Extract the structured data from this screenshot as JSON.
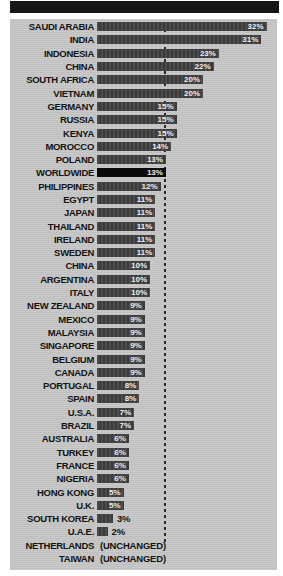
{
  "header": {
    "banner_text": ""
  },
  "chart_data": {
    "type": "bar",
    "orientation": "horizontal",
    "title": "",
    "unit": "%",
    "reference_label": "WORLDWIDE",
    "reference_value": 13,
    "grid": "off",
    "legend": "none",
    "xlim": [
      0,
      34
    ],
    "rows": [
      {
        "label": "SAUDI ARABIA",
        "value": 32,
        "display": "32%"
      },
      {
        "label": "INDIA",
        "value": 31,
        "display": "31%"
      },
      {
        "label": "INDONESIA",
        "value": 23,
        "display": "23%"
      },
      {
        "label": "CHINA",
        "value": 22,
        "display": "22%"
      },
      {
        "label": "SOUTH AFRICA",
        "value": 20,
        "display": "20%"
      },
      {
        "label": "VIETNAM",
        "value": 20,
        "display": "20%"
      },
      {
        "label": "GERMANY",
        "value": 15,
        "display": "15%"
      },
      {
        "label": "RUSSIA",
        "value": 15,
        "display": "15%"
      },
      {
        "label": "KENYA",
        "value": 15,
        "display": "15%"
      },
      {
        "label": "MOROCCO",
        "value": 14,
        "display": "14%"
      },
      {
        "label": "POLAND",
        "value": 13,
        "display": "13%"
      },
      {
        "label": "WORLDWIDE",
        "value": 13,
        "display": "13%",
        "emphasis": true
      },
      {
        "label": "PHILIPPINES",
        "value": 12,
        "display": "12%"
      },
      {
        "label": "EGYPT",
        "value": 11,
        "display": "11%"
      },
      {
        "label": "JAPAN",
        "value": 11,
        "display": "11%"
      },
      {
        "label": "THAILAND",
        "value": 11,
        "display": "11%"
      },
      {
        "label": "IRELAND",
        "value": 11,
        "display": "11%"
      },
      {
        "label": "SWEDEN",
        "value": 11,
        "display": "11%"
      },
      {
        "label": "CHINA",
        "value": 10,
        "display": "10%"
      },
      {
        "label": "ARGENTINA",
        "value": 10,
        "display": "10%"
      },
      {
        "label": "ITALY",
        "value": 10,
        "display": "10%"
      },
      {
        "label": "NEW ZEALAND",
        "value": 9,
        "display": "9%"
      },
      {
        "label": "MEXICO",
        "value": 9,
        "display": "9%"
      },
      {
        "label": "MALAYSIA",
        "value": 9,
        "display": "9%"
      },
      {
        "label": "SINGAPORE",
        "value": 9,
        "display": "9%"
      },
      {
        "label": "BELGIUM",
        "value": 9,
        "display": "9%"
      },
      {
        "label": "CANADA",
        "value": 9,
        "display": "9%"
      },
      {
        "label": "PORTUGAL",
        "value": 8,
        "display": "8%"
      },
      {
        "label": "SPAIN",
        "value": 8,
        "display": "8%"
      },
      {
        "label": "U.S.A.",
        "value": 7,
        "display": "7%"
      },
      {
        "label": "BRAZIL",
        "value": 7,
        "display": "7%"
      },
      {
        "label": "AUSTRALIA",
        "value": 6,
        "display": "6%"
      },
      {
        "label": "TURKEY",
        "value": 6,
        "display": "6%"
      },
      {
        "label": "FRANCE",
        "value": 6,
        "display": "6%"
      },
      {
        "label": "NIGERIA",
        "value": 6,
        "display": "6%"
      },
      {
        "label": "HONG KONG",
        "value": 5,
        "display": "5%"
      },
      {
        "label": "U.K.",
        "value": 5,
        "display": "5%"
      },
      {
        "label": "SOUTH KOREA",
        "value": 3,
        "display": "3%",
        "label_outside": true
      },
      {
        "label": "U.A.E.",
        "value": 2,
        "display": "2%",
        "label_outside": true
      },
      {
        "label": "NETHERLANDS",
        "value": null,
        "display": "(UNCHANGED)"
      },
      {
        "label": "TAIWAN",
        "value": null,
        "display": "(UNCHANGED)"
      }
    ],
    "colors": {
      "header_bar": "#161616",
      "panel_bg": "#c6c6c6",
      "bar": "#3e3e3e",
      "worldwide_bar": "#0a0a0a",
      "value_text_in_bar": "#ececec",
      "label_text": "#141414",
      "dashed_line": "#2b2b2b"
    },
    "pixels_per_percent": 5.3
  }
}
